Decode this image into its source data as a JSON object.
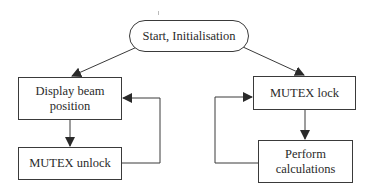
{
  "diagram": {
    "type": "flowchart",
    "nodes": {
      "start": {
        "label": "Start, Initialisation",
        "shape": "oval"
      },
      "display": {
        "label": "Display beam position",
        "label_lines": [
          "Display beam",
          "position"
        ],
        "shape": "rect"
      },
      "unlock": {
        "label": "MUTEX unlock",
        "shape": "rect"
      },
      "lock": {
        "label": "MUTEX lock",
        "shape": "rect"
      },
      "perform": {
        "label": "Perform calculations",
        "label_lines": [
          "Perform",
          "calculations"
        ],
        "shape": "rect"
      }
    },
    "edges": [
      {
        "from": "start",
        "to": "display"
      },
      {
        "from": "start",
        "to": "lock"
      },
      {
        "from": "display",
        "to": "unlock"
      },
      {
        "from": "unlock",
        "to": "display",
        "kind": "loop-back"
      },
      {
        "from": "lock",
        "to": "perform"
      },
      {
        "from": "perform",
        "to": "lock",
        "kind": "loop-back"
      }
    ],
    "colors": {
      "line": "#3a3a3a",
      "background": "#ffffff",
      "text": "#2a2a2a"
    }
  }
}
